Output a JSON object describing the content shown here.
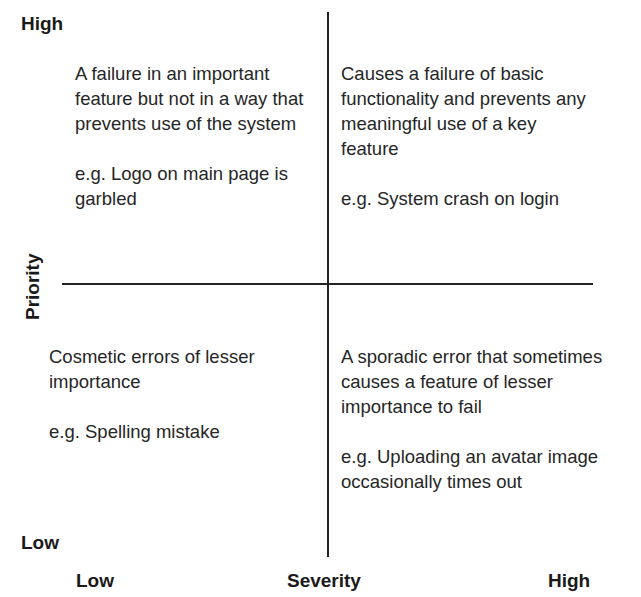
{
  "y_axis": {
    "title": "Priority",
    "high_label": "High",
    "low_label": "Low"
  },
  "x_axis": {
    "title": "Severity",
    "low_label": "Low",
    "high_label": "High"
  },
  "quadrants": {
    "high_priority_low_severity": {
      "description": "A failure in an important feature but not in a way that prevents use of the system",
      "example": "e.g. Logo on main page is garbled"
    },
    "high_priority_high_severity": {
      "description": "Causes a failure of basic functionality and prevents any meaningful use of a key feature",
      "example": "e.g. System crash on login"
    },
    "low_priority_low_severity": {
      "description": "Cosmetic errors of lesser importance",
      "example": "e.g. Spelling mistake"
    },
    "low_priority_high_severity": {
      "description": "A sporadic error that sometimes causes a feature of lesser importance to fail",
      "example": "e.g. Uploading an avatar image occasionally times out"
    }
  },
  "colors": {
    "line": "#222222",
    "text": "#262626",
    "background": "#ffffff"
  }
}
